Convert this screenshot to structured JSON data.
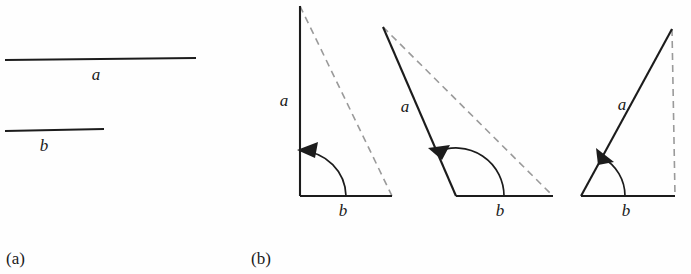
{
  "figure": {
    "background_color": "#fefefe",
    "stroke_color": "#1c1c1c",
    "dashed_color": "#9a9a9a"
  },
  "panels": [
    {
      "id": "panel-a",
      "label": "(a)",
      "label_x": 6,
      "label_y": 264,
      "segments": [
        {
          "name": "segment-a",
          "label": "a",
          "x1": 5,
          "y1": 60,
          "x2": 196,
          "y2": 58,
          "width": 2.1,
          "label_x": 96,
          "label_y": 80
        },
        {
          "name": "segment-b",
          "label": "b",
          "x1": 5,
          "y1": 131,
          "x2": 104,
          "y2": 129,
          "width": 2.1,
          "label_x": 44,
          "label_y": 151
        }
      ]
    },
    {
      "id": "panel-b",
      "label": "(b)",
      "label_x": 251,
      "label_y": 264,
      "triangles": [
        {
          "name": "triangle-obtuse-90",
          "vertex_x": 300,
          "vertex_y": 196,
          "side_a": {
            "label": "a",
            "end_x": 300,
            "end_y": 6,
            "label_x": 284,
            "label_y": 106,
            "width": 2.1
          },
          "side_b": {
            "label": "b",
            "end_x": 392,
            "end_y": 196,
            "label_x": 343,
            "label_y": 216,
            "width": 2.1
          },
          "dashed": {
            "x1": 300,
            "y1": 6,
            "x2": 392,
            "y2": 196
          },
          "arc": {
            "radius": 46,
            "start_deg": 0,
            "end_deg": 90
          },
          "arrow_deg": 90,
          "angle_value_deg": 90
        },
        {
          "name": "triangle-obtuse-wide",
          "vertex_x": 456,
          "vertex_y": 196,
          "side_a": {
            "label": "a",
            "end_x": 383,
            "end_y": 27,
            "label_x": 405,
            "label_y": 112,
            "width": 2.1
          },
          "side_b": {
            "label": "b",
            "end_x": 553,
            "end_y": 196,
            "label_x": 500,
            "label_y": 216,
            "width": 2.1
          },
          "dashed": {
            "x1": 383,
            "y1": 27,
            "x2": 553,
            "y2": 196
          },
          "arc": {
            "radius": 48,
            "start_deg": 0,
            "end_deg": 113
          },
          "arrow_deg": 113,
          "angle_value_deg": 113
        },
        {
          "name": "triangle-acute",
          "vertex_x": 581,
          "vertex_y": 196,
          "side_a": {
            "label": "a",
            "end_x": 672,
            "end_y": 29,
            "label_x": 622,
            "label_y": 110,
            "width": 2.1
          },
          "side_b": {
            "label": "b",
            "end_x": 675,
            "end_y": 196,
            "label_x": 626,
            "label_y": 216,
            "width": 2.1
          },
          "dashed": {
            "x1": 672,
            "y1": 29,
            "x2": 675,
            "y2": 196
          },
          "arc": {
            "radius": 44,
            "start_deg": 0,
            "end_deg": 61
          },
          "arrow_deg": 61,
          "angle_value_deg": 61
        }
      ]
    }
  ]
}
